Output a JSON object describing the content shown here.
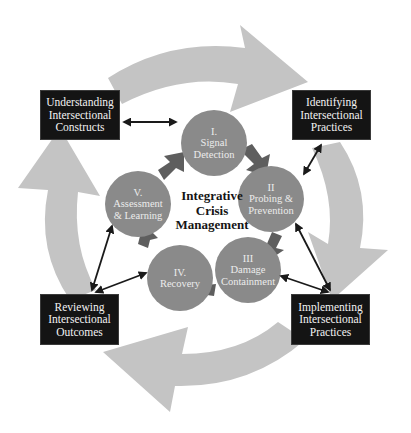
{
  "diagram": {
    "title": "Integrative Crisis Management",
    "center_label": [
      "Integrative",
      "Crisis",
      "Management"
    ],
    "colors": {
      "background": "#ffffff",
      "outer_arrow": "#c4c4c4",
      "phase_circle": "#8a8a8a",
      "inner_arrow": "#5e5e5e",
      "box_fill": "#141414",
      "box_text": "#f2f2f2",
      "connector": "#1a1a1a"
    },
    "phases": [
      {
        "id": "I",
        "lines": [
          "I.",
          "Signal",
          "Detection"
        ]
      },
      {
        "id": "II",
        "lines": [
          "II",
          "Probing &",
          "Prevention"
        ]
      },
      {
        "id": "III",
        "lines": [
          "III",
          "Damage",
          "Containment"
        ]
      },
      {
        "id": "IV",
        "lines": [
          "IV.",
          "Recovery"
        ]
      },
      {
        "id": "V",
        "lines": [
          "V.",
          "Assessment",
          "& Learning"
        ]
      }
    ],
    "boxes": [
      {
        "id": "understanding",
        "lines": [
          "Understanding",
          "Intersectional",
          "Constructs"
        ]
      },
      {
        "id": "identifying",
        "lines": [
          "Identifying",
          "Intersectional",
          "Practices"
        ]
      },
      {
        "id": "implementing",
        "lines": [
          "Implementing",
          "Intersectional",
          "Practices"
        ]
      },
      {
        "id": "reviewing",
        "lines": [
          "Reviewing",
          "Intersectional",
          "Outcomes"
        ]
      }
    ]
  }
}
